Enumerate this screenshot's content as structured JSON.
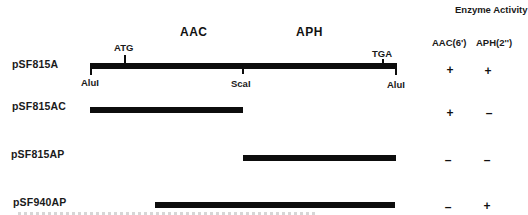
{
  "header": {
    "enzyme_activity": "Enzyme Activity",
    "col_aac": "AAC(6')",
    "col_aph": "APH(2'')"
  },
  "genes": {
    "aac": "AAC",
    "aph": "APH"
  },
  "sites": {
    "atg": "ATG",
    "tga": "TGA",
    "alui_left": "AluI",
    "scai": "ScaI",
    "alui_right": "AluI"
  },
  "constructs": [
    {
      "name": "pSF815A",
      "start_px": 90,
      "end_px": 396,
      "aac": "+",
      "aph": "+"
    },
    {
      "name": "pSF815AC",
      "start_px": 90,
      "end_px": 243,
      "aac": "+",
      "aph": "–"
    },
    {
      "name": "pSF815AP",
      "start_px": 243,
      "end_px": 396,
      "aac": "–",
      "aph": "–"
    },
    {
      "name": "pSF940AP",
      "start_px": 155,
      "end_px": 395,
      "aac": "–",
      "aph": "+"
    }
  ],
  "colors": {
    "bar": "#0d0d0d",
    "text": "#1a1a1a",
    "background": "#ffffff"
  }
}
